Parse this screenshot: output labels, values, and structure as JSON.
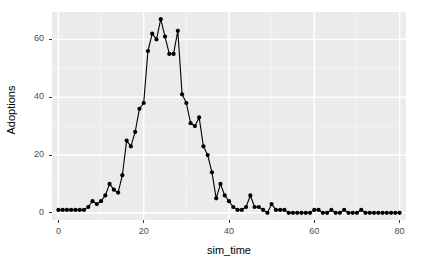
{
  "chart_data": {
    "type": "line",
    "title": "",
    "subtitle": "",
    "xlabel": "sim_time",
    "ylabel": "Adoptions",
    "xlim": [
      -1.5,
      81.5
    ],
    "ylim": [
      -2.5,
      69.5
    ],
    "xticks": [
      0,
      20,
      40,
      60,
      80
    ],
    "yticks": [
      0,
      20,
      40,
      60
    ],
    "xtick_labels": [
      "0",
      "20",
      "40",
      "60",
      "80"
    ],
    "ytick_labels": [
      "0",
      "20",
      "40",
      "60"
    ],
    "grid": true,
    "grid_major_color": "#ffffff",
    "grid_minor_color": "#f5f5f5",
    "panel_background": "#ebebeb",
    "legend": null,
    "legend_position": "none",
    "marker": "circle",
    "marker_color": "#000000",
    "line_color": "#000000",
    "series": [
      {
        "name": "Adoptions",
        "x": [
          0,
          1,
          2,
          3,
          4,
          5,
          6,
          7,
          8,
          9,
          10,
          11,
          12,
          13,
          14,
          15,
          16,
          17,
          18,
          19,
          20,
          21,
          22,
          23,
          24,
          25,
          26,
          27,
          28,
          29,
          30,
          31,
          32,
          33,
          34,
          35,
          36,
          37,
          38,
          39,
          40,
          41,
          42,
          43,
          44,
          45,
          46,
          47,
          48,
          49,
          50,
          51,
          52,
          53,
          54,
          55,
          56,
          57,
          58,
          59,
          60,
          61,
          62,
          63,
          64,
          65,
          66,
          67,
          68,
          69,
          70,
          71,
          72,
          73,
          74,
          75,
          76,
          77,
          78,
          79,
          80
        ],
        "y": [
          1,
          1,
          1,
          1,
          1,
          1,
          1,
          2,
          4,
          3,
          4,
          6,
          10,
          8,
          7,
          13,
          25,
          23,
          28,
          36,
          38,
          56,
          62,
          60,
          67,
          61,
          55,
          55,
          63,
          41,
          38,
          31,
          30,
          33,
          23,
          20,
          14,
          5,
          10,
          6,
          4,
          2,
          1,
          1,
          2,
          6,
          2,
          2,
          1,
          0,
          3,
          1,
          1,
          1,
          0,
          0,
          0,
          0,
          0,
          0,
          1,
          1,
          0,
          0,
          1,
          0,
          0,
          1,
          0,
          0,
          0,
          1,
          0,
          0,
          0,
          0,
          0,
          0,
          0,
          0,
          0
        ]
      }
    ]
  },
  "axis": {
    "x_title": "sim_time",
    "y_title": "Adoptions",
    "x_tick_labels": [
      "0",
      "20",
      "40",
      "60",
      "80"
    ],
    "y_tick_labels": [
      "0",
      "20",
      "40",
      "60"
    ]
  }
}
